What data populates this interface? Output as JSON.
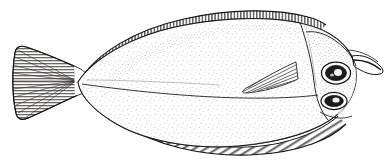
{
  "figure": {
    "subject_name": "flatfish-lateral-view",
    "common_name": "Flounder",
    "style": "pen-and-ink scientific illustration",
    "orientation": "head facing right",
    "caption": "",
    "title": "",
    "background_color": "#ffffff",
    "ink_color": "#1a1a1a",
    "body_fill_color": "#fefefe",
    "fin_shade_color": "#55534f",
    "canvas": {
      "width": 391,
      "height": 168
    }
  },
  "anatomy": {
    "parts": [
      {
        "id": "body",
        "label": "Body",
        "description": "Oval, laterally compressed flatfish body with dense stipple shading"
      },
      {
        "id": "caudal-fin",
        "label": "Caudal fin",
        "description": "Fan-shaped tail fin with radiating fin rays"
      },
      {
        "id": "caudal-peduncle",
        "label": "Caudal peduncle",
        "description": "Narrow stalk joining body to tail"
      },
      {
        "id": "dorsal-fin",
        "label": "Dorsal fin",
        "description": "Long continuous fin along the upper margin with vertical ray hatching"
      },
      {
        "id": "anal-fin",
        "label": "Anal fin",
        "description": "Long continuous fin along the lower margin with diagonal ray hatching"
      },
      {
        "id": "pectoral-fin",
        "label": "Pectoral fin",
        "description": "Pointed triangular fin behind the gill cover with ray lines"
      },
      {
        "id": "upper-eye",
        "label": "Upper eye",
        "description": "Large eye with dark pupil and pale highlight"
      },
      {
        "id": "lower-eye",
        "label": "Lower eye",
        "description": "Second eye on the same side, set below and slightly forward"
      },
      {
        "id": "mouth",
        "label": "Mouth",
        "description": "Terminal mouth at the front of the snout"
      },
      {
        "id": "operculum",
        "label": "Gill cover",
        "description": "Curved opercular margin behind the head"
      },
      {
        "id": "lateral-line",
        "label": "Lateral line",
        "description": "Fine line running the length of the body"
      },
      {
        "id": "head",
        "label": "Head",
        "description": "Blunt head region bearing both eyes on the ocular side"
      }
    ]
  }
}
